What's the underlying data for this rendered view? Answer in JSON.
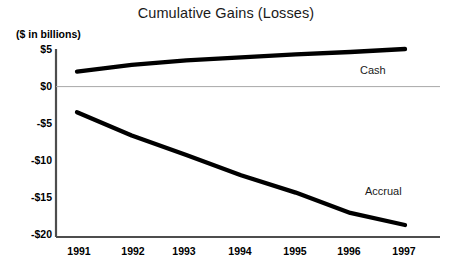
{
  "chart_data": {
    "type": "line",
    "title": "Cumulative Gains (Losses)",
    "subtitle": "($ in billions)",
    "xlabel": "",
    "ylabel": "($ in billions)",
    "categories": [
      "1991",
      "1992",
      "1993",
      "1994",
      "1995",
      "1996",
      "1997"
    ],
    "x": [
      1991,
      1992,
      1993,
      1994,
      1995,
      1996,
      1997
    ],
    "ylim": [
      -20,
      5
    ],
    "xlim": [
      1991,
      1997
    ],
    "yticks": [
      5,
      0,
      -5,
      -10,
      -15,
      -20
    ],
    "ytick_labels": [
      "$5",
      "$0",
      "-$5",
      "-$10",
      "-$15",
      "-$20"
    ],
    "xtick_labels": [
      "1991",
      "1992",
      "1993",
      "1994",
      "1995",
      "1996",
      "1997"
    ],
    "grid": false,
    "zero_line": true,
    "legend": "inline-series-labels",
    "series": [
      {
        "name": "Cash",
        "values": [
          2.0,
          2.9,
          3.5,
          3.9,
          4.3,
          4.6,
          5.0
        ],
        "color": "#000000",
        "label_text": "Cash"
      },
      {
        "name": "Accrual",
        "values": [
          -3.4,
          -6.5,
          -9.1,
          -11.8,
          -14.1,
          -16.8,
          -18.4
        ],
        "color": "#000000",
        "label_text": "Accrual"
      }
    ],
    "annotations": [
      {
        "text": "Cash",
        "series": "Cash"
      },
      {
        "text": "Accrual",
        "series": "Accrual"
      }
    ],
    "colors": {
      "line": "#111111",
      "axis": "#4d4d4d",
      "zero_line": "#9a9a9a",
      "text": "#000000",
      "background": "#ffffff"
    }
  },
  "axis": {
    "unit_label": "($ in billions)",
    "y_labels": [
      "$5",
      "$0",
      "-$5",
      "-$10",
      "-$15",
      "-$20"
    ],
    "x_labels": [
      "1991",
      "1992",
      "1993",
      "1994",
      "1995",
      "1996",
      "1997"
    ]
  },
  "labels": {
    "cash": "Cash",
    "accrual": "Accrual"
  }
}
